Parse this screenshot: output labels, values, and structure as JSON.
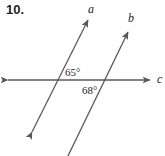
{
  "problem": {
    "number": "10."
  },
  "figure": {
    "type": "geometry-diagram",
    "stroke_color": "#57585b",
    "text_color": "#231f20",
    "background_color": "#ffffff",
    "lines": [
      {
        "id": "line-a",
        "label": "a",
        "label_x": 88,
        "label_y": 3,
        "x1": 32,
        "y1": 132,
        "x2": 88,
        "y2": 20,
        "arrow_start": true,
        "arrow_end": true
      },
      {
        "id": "line-b",
        "label": "b",
        "label_x": 128,
        "label_y": 12,
        "x1": 67,
        "y1": 158,
        "x2": 128,
        "y2": 32,
        "arrow_start": false,
        "arrow_end": true
      },
      {
        "id": "line-c",
        "label": "c",
        "label_x": 157,
        "label_y": 73,
        "x1": 8,
        "y1": 80,
        "x2": 150,
        "y2": 80,
        "arrow_start": true,
        "arrow_end": true
      }
    ],
    "angles": [
      {
        "id": "angle-65",
        "value": "65°",
        "degrees": 65,
        "label_x": 65,
        "label_y": 67,
        "at_intersection": "line-a-with-line-c",
        "position": "above-right"
      },
      {
        "id": "angle-68",
        "value": "68°",
        "degrees": 68,
        "label_x": 82,
        "label_y": 85,
        "at_intersection": "line-b-with-line-c",
        "position": "below-left"
      }
    ]
  }
}
